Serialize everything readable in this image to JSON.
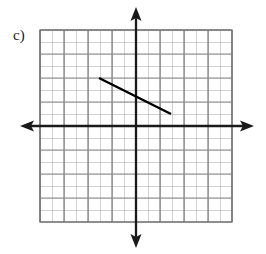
{
  "label": {
    "text": "c)"
  },
  "colors": {
    "grid_line": "#9a9a9a",
    "grid_line_major": "#6e6e6e",
    "axis": "#1a1a1a",
    "segment": "#000000",
    "background": "#ffffff"
  },
  "chart_data": {
    "type": "line",
    "title": "",
    "subtitle": "",
    "xlabel": "",
    "ylabel": "",
    "grid": true,
    "legend": null,
    "annotations": [
      "c)"
    ],
    "axis_style": "double-arrow-cartesian",
    "cell_count_x": 16,
    "cell_count_y": 16,
    "cell_size_px": 12,
    "xlim": [
      -8,
      8
    ],
    "ylim": [
      -8,
      8
    ],
    "xticks": [
      -8,
      -7,
      -6,
      -5,
      -4,
      -3,
      -2,
      -1,
      0,
      1,
      2,
      3,
      4,
      5,
      6,
      7,
      8
    ],
    "yticks": [
      -8,
      -7,
      -6,
      -5,
      -4,
      -3,
      -2,
      -1,
      0,
      1,
      2,
      3,
      4,
      5,
      6,
      7,
      8
    ],
    "xtick_labels": [],
    "ytick_labels": [],
    "series": [
      {
        "name": "segment",
        "type": "segment",
        "x": [
          -3,
          3
        ],
        "y": [
          4,
          1
        ],
        "slope": -0.5,
        "y_intercept": 2.5,
        "endpoints_px": [
          [
            99,
            78
          ],
          [
            171,
            114
          ]
        ]
      }
    ]
  },
  "geometry": {
    "grid_left_px": 40,
    "grid_top_px": 30,
    "grid_right_px": 232,
    "grid_bottom_px": 222,
    "origin_x_px": 136,
    "origin_y_px": 126,
    "x_axis_left_tip_px": 20,
    "x_axis_right_tip_px": 254,
    "y_axis_top_tip_px": 7,
    "y_axis_bottom_tip_px": 248
  }
}
